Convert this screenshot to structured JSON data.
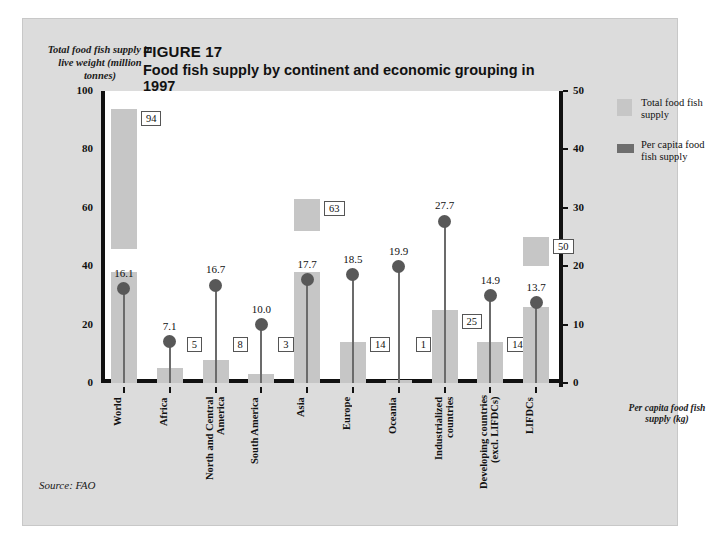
{
  "figure": {
    "number": "FIGURE 17",
    "title": "Food fish supply by continent and economic grouping in 1997",
    "source": "Source: FAO",
    "axis_label_left": "Total food fish supply in live weight (million tonnes)",
    "axis_label_right": "Per capita food fish supply (kg)"
  },
  "legend": {
    "position": "right",
    "items": [
      {
        "label": "Total food fish supply",
        "color": "#c6c6c6",
        "icon": "bar-swatch-icon"
      },
      {
        "label": "Per capita food fish supply",
        "color": "#6e6e6e",
        "icon": "lollipop-swatch-icon"
      }
    ]
  },
  "colors": {
    "panel_background": "#dcdcdc",
    "plot_background": "#ffffff",
    "axis": "#111111",
    "bar": "#c6c6c6",
    "marker": "#585858",
    "stem": "#6b6b6b"
  },
  "chart_data": {
    "type": "bar",
    "title": "Food fish supply by continent and economic grouping in 1997",
    "xlabel": "",
    "ylabel": "Total food fish supply in live weight (million tonnes)",
    "y2label": "Per capita food fish supply (kg)",
    "ylim": [
      0,
      100
    ],
    "y2lim": [
      0,
      50
    ],
    "yticks": [
      "100",
      "80",
      "60",
      "40",
      "20",
      "0"
    ],
    "y2ticks": [
      "50",
      "40",
      "30",
      "20",
      "10",
      "0"
    ],
    "grid": false,
    "categories": [
      "World",
      "Africa",
      "North and Central\nAmerica",
      "South America",
      "Asia",
      "Europe",
      "Oceania",
      "Industrialized\ncountries",
      "Developing countries\n(excl. LIFDCs)",
      "LIFDCs"
    ],
    "series": [
      {
        "name": "Total food fish supply",
        "unit": "million tonnes",
        "axis": "left",
        "values": [
          94,
          5,
          8,
          3,
          63,
          14,
          1,
          25,
          14,
          50
        ],
        "labels": [
          "94",
          "5",
          "8",
          "3",
          "63",
          "14",
          "1",
          "25",
          "14",
          "50"
        ]
      },
      {
        "name": "Per capita food fish supply",
        "unit": "kg",
        "axis": "right",
        "values": [
          16.1,
          7.1,
          16.7,
          10.0,
          17.7,
          18.5,
          19.9,
          27.7,
          14.9,
          13.7
        ],
        "labels": [
          "16.1",
          "7.1",
          "16.7",
          "10.0",
          "17.7",
          "18.5",
          "19.9",
          "27.7",
          "14.9",
          "13.7"
        ]
      }
    ]
  }
}
